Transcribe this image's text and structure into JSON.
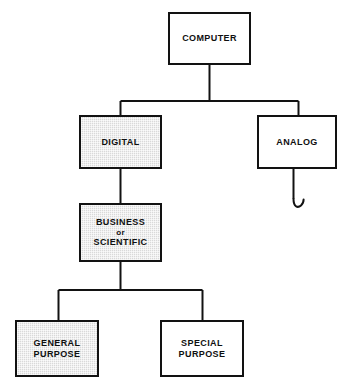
{
  "diagram": {
    "background_color": "#ffffff",
    "line_color": "#121212",
    "shade_color": "#d9d9d9",
    "nodes": [
      {
        "id": "computer",
        "label": "COMPUTER",
        "shaded": false,
        "x": 168,
        "y": 12,
        "w": 83,
        "h": 53,
        "font_size": 9
      },
      {
        "id": "digital",
        "label": "DIGITAL",
        "shaded": true,
        "x": 79,
        "y": 115,
        "w": 83,
        "h": 54,
        "font_size": 9
      },
      {
        "id": "analog",
        "label": "ANALOG",
        "shaded": false,
        "x": 257,
        "y": 115,
        "w": 80,
        "h": 54,
        "font_size": 9
      },
      {
        "id": "business-or-scientific",
        "line1": "BUSINESS",
        "line2": "or",
        "line3": "SCIENTIFIC",
        "shaded": true,
        "x": 79,
        "y": 203,
        "w": 83,
        "h": 59,
        "font_size": 9
      },
      {
        "id": "general-purpose",
        "line1": "GENERAL",
        "line2": "PURPOSE",
        "shaded": true,
        "x": 15,
        "y": 320,
        "w": 84,
        "h": 57,
        "font_size": 9
      },
      {
        "id": "special-purpose",
        "line1": "SPECIAL",
        "line2": "PURPOSE",
        "shaded": false,
        "x": 160,
        "y": 320,
        "w": 84,
        "h": 57,
        "font_size": 9
      }
    ],
    "connectors": {
      "computer_stem": "M 209.5 65 L 209.5 101",
      "top_bus": "M 120.5 101 L 298.5 101",
      "digital_drop": "M 120.5 101 L 120.5 115",
      "analog_drop": "M 298.5 101 L 298.5 115",
      "digital_to_business": "M 120.5 169 L 120.5 203",
      "business_stem": "M 120.5 262 L 120.5 290",
      "bottom_bus": "M 58.5 290 L 202.5 290",
      "general_drop": "M 58.5 290 L 58.5 320",
      "special_drop": "M 202.5 290 L 202.5 320",
      "analog_tail": "M 293.5 169 L 293.5 199",
      "analog_curl": "M 293.5 199 C 293.5 206.5 297.5 208.5 301 205.5 C 303 203.8 303.6 201.6 303.6 199.6"
    }
  }
}
